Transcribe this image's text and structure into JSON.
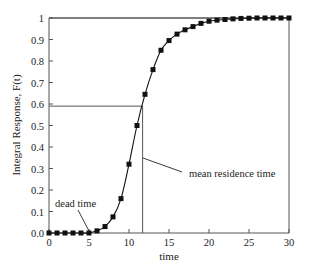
{
  "chart_data": {
    "type": "line",
    "title": "",
    "xlabel": "time",
    "ylabel": "Integral Response, F(t)",
    "xlim": [
      0,
      30
    ],
    "ylim": [
      0,
      1
    ],
    "xticks": [
      0,
      5,
      10,
      15,
      20,
      25,
      30
    ],
    "xtick_labels": [
      "0",
      "5",
      "10",
      "15",
      "20",
      "25",
      "30"
    ],
    "yticks": [
      0,
      0.1,
      0.2,
      0.3,
      0.4,
      0.5,
      0.6,
      0.7,
      0.8,
      0.9,
      1
    ],
    "ytick_labels": [
      "0.0",
      "0.1",
      "0.2",
      "0.3",
      "0.4",
      "0.5",
      "0.6",
      "0.7",
      "0.8",
      "0.9",
      "1"
    ],
    "grid": false,
    "legend": null,
    "series": [
      {
        "name": "F(t)",
        "marker": "square",
        "x": [
          0,
          1,
          2,
          3,
          4,
          5,
          6,
          7,
          8,
          9,
          10,
          11,
          12,
          13,
          14,
          15,
          16,
          17,
          18,
          19,
          20,
          21,
          22,
          23,
          24,
          25,
          26,
          27,
          28,
          29,
          30
        ],
        "values": [
          0,
          0,
          0,
          0,
          0,
          0,
          0.01,
          0.03,
          0.075,
          0.16,
          0.32,
          0.5,
          0.645,
          0.76,
          0.85,
          0.895,
          0.925,
          0.945,
          0.96,
          0.975,
          0.985,
          0.99,
          0.993,
          0.996,
          0.998,
          0.999,
          1,
          1,
          1,
          1,
          1
        ]
      }
    ],
    "reference_lines": [
      {
        "type": "horizontal",
        "y": 0.59,
        "x_from": 0,
        "x_to": 11.7
      },
      {
        "type": "vertical",
        "x": 11.7,
        "y_from": 0,
        "y_to": 0.59
      },
      {
        "type": "horizontal",
        "y": 1.0,
        "x_from": 0,
        "x_to": 30
      }
    ],
    "annotations": [
      {
        "text": "dead time",
        "points_to": {
          "x": 5,
          "y": 0
        }
      },
      {
        "text": "mean residence time",
        "points_to": {
          "x": 11.7,
          "y": 0.35
        }
      }
    ]
  }
}
